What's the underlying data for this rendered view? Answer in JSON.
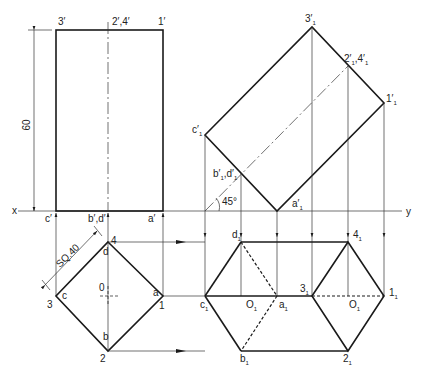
{
  "axis": {
    "x_label": "x",
    "y_label": "y"
  },
  "dimensions": {
    "height": "60",
    "square": "SQ.40",
    "angle": "45°"
  },
  "front_view": {
    "labels": {
      "p3": "3′",
      "p24": "2′,4′",
      "p1": "1′",
      "c": "c′",
      "bd": "b′,d′",
      "a": "a′"
    }
  },
  "top_view": {
    "labels": {
      "n4": "4",
      "n1": "1",
      "n2": "2",
      "n3": "3",
      "d": "d",
      "a": "a",
      "b": "b",
      "c": "c",
      "o": "0"
    }
  },
  "aux_front_view": {
    "labels": {
      "p3": "3′",
      "p24": "2′,4′",
      "p1": "1′",
      "c": "c′",
      "bd": "b′,d′",
      "a": "a′"
    },
    "subscript": "1"
  },
  "aux_top_view": {
    "labels": {
      "d": "d",
      "c": "c",
      "o1": "O",
      "a": "a",
      "b": "b",
      "n3": "3",
      "n4": "4",
      "n1": "1",
      "n2": "2",
      "o2": "O"
    },
    "subscript": "1"
  }
}
